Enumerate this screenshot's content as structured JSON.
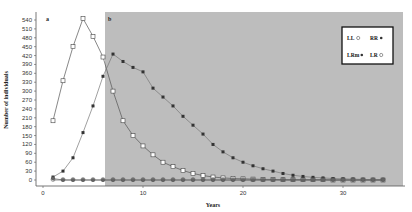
{
  "chart_data": {
    "type": "line",
    "title": "",
    "xlabel": "Years",
    "ylabel": "Number of individuals",
    "xlim": [
      0,
      36
    ],
    "ylim": [
      0,
      540
    ],
    "yticks": [
      0,
      30,
      60,
      90,
      120,
      150,
      180,
      210,
      240,
      270,
      300,
      330,
      360,
      390,
      420,
      450,
      480,
      510,
      540
    ],
    "xticks": [
      0,
      10,
      20,
      30
    ],
    "grid": false,
    "legend_position": "upper right",
    "panels": [
      {
        "label": "a",
        "x_range": [
          0,
          6.2
        ],
        "background": "#ffffff"
      },
      {
        "label": "b",
        "x_range": [
          6.2,
          36
        ],
        "background": "#bdbdbd"
      }
    ],
    "x": [
      1,
      2,
      3,
      4,
      5,
      6,
      7,
      8,
      9,
      10,
      11,
      12,
      13,
      14,
      15,
      16,
      17,
      18,
      19,
      20,
      21,
      22,
      23,
      24,
      25,
      26,
      27,
      28,
      29,
      30,
      31,
      32,
      33,
      34
    ],
    "series": [
      {
        "name": "LL",
        "marker": "open-square",
        "values": [
          200,
          335,
          450,
          545,
          485,
          415,
          300,
          200,
          150,
          115,
          85,
          60,
          45,
          32,
          22,
          15,
          10,
          7,
          5,
          4,
          3,
          2,
          2,
          1,
          1,
          1,
          1,
          1,
          0,
          0,
          0,
          0,
          0,
          0
        ]
      },
      {
        "name": "RR",
        "marker": "filled-square",
        "values": [
          10,
          30,
          75,
          160,
          250,
          350,
          425,
          400,
          380,
          365,
          310,
          280,
          250,
          215,
          185,
          155,
          120,
          95,
          75,
          60,
          48,
          38,
          30,
          22,
          16,
          12,
          9,
          7,
          5,
          4,
          3,
          2,
          1,
          1
        ]
      },
      {
        "name": "LRm",
        "marker": "filled-circle",
        "values": [
          5,
          0,
          0,
          0,
          0,
          0,
          0,
          0,
          0,
          0,
          0,
          0,
          0,
          0,
          0,
          0,
          0,
          0,
          0,
          0,
          0,
          0,
          0,
          0,
          0,
          0,
          0,
          0,
          0,
          0,
          0,
          0,
          0,
          0
        ]
      },
      {
        "name": "LR",
        "marker": "open-circle",
        "values": [
          0,
          0,
          0,
          0,
          0,
          0,
          0,
          0,
          0,
          0,
          0,
          0,
          0,
          0,
          0,
          0,
          0,
          0,
          0,
          0,
          0,
          0,
          0,
          0,
          0,
          0,
          0,
          0,
          0,
          0,
          0,
          0,
          0,
          0
        ]
      }
    ],
    "legend": [
      {
        "name": "LL",
        "symbol": "○"
      },
      {
        "name": "RR",
        "symbol": "●"
      },
      {
        "name": "LRm",
        "symbol": "●"
      },
      {
        "name": "LR",
        "symbol": "○"
      }
    ]
  }
}
